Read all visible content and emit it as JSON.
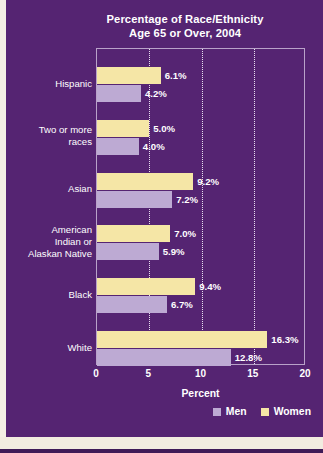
{
  "chart_data": {
    "type": "bar",
    "orientation": "horizontal",
    "title": "Percentage of Race/Ethnicity Age 65 or Over, 2004",
    "title_lines": [
      "Percentage of Race/Ethnicity",
      "Age 65 or Over, 2004"
    ],
    "categories": [
      "Hispanic",
      "Two or more races",
      "Asian",
      "American Indian or Alaskan Native",
      "Black",
      "White"
    ],
    "category_lines": [
      [
        "Hispanic"
      ],
      [
        "Two or more",
        "races"
      ],
      [
        "Asian"
      ],
      [
        "American",
        "Indian or",
        "Alaskan Native"
      ],
      [
        "Black"
      ],
      [
        "White"
      ]
    ],
    "series": [
      {
        "name": "Women",
        "color": "#f5e6a6",
        "values": [
          6.1,
          5.0,
          9.2,
          7.0,
          9.4,
          16.3
        ],
        "labels": [
          "6.1%",
          "5.0%",
          "9.2%",
          "7.0%",
          "9.4%",
          "16.3%"
        ]
      },
      {
        "name": "Men",
        "color": "#bdaad3",
        "values": [
          4.2,
          4.0,
          7.2,
          5.9,
          6.7,
          12.8
        ],
        "labels": [
          "4.2%",
          "4.0%",
          "7.2%",
          "5.9%",
          "6.7%",
          "12.8%"
        ]
      }
    ],
    "xlabel": "Percent",
    "ylabel": "",
    "xlim": [
      0,
      20
    ],
    "xticks": [
      0,
      5,
      10,
      15,
      20
    ],
    "xtick_labels": [
      "0",
      "5",
      "10",
      "15",
      "20"
    ],
    "grid": true,
    "grid_style": "dotted-vertical",
    "legend_position": "bottom-right",
    "legend_order": [
      "Men",
      "Women"
    ],
    "background_color": "#552472",
    "text_color": "#ffffff"
  }
}
